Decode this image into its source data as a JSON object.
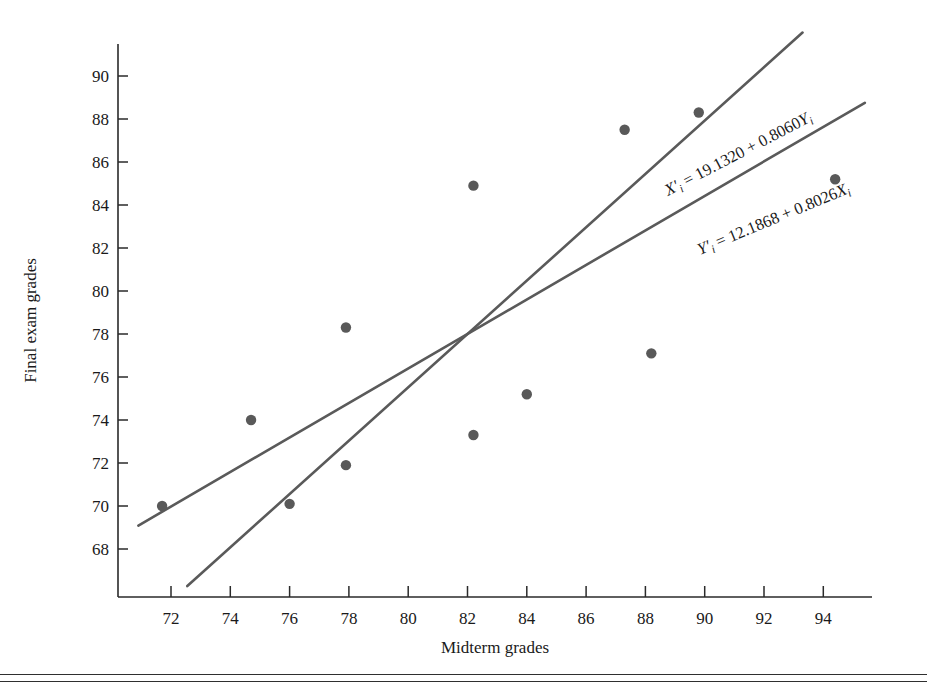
{
  "chart_data": {
    "type": "scatter",
    "title": "",
    "xlabel": "Midterm grades",
    "ylabel": "Final exam grades",
    "xlim": [
      70.6,
      95.6
    ],
    "ylim": [
      66.6,
      91.2
    ],
    "grid": false,
    "legend": "none",
    "x_ticks": [
      72,
      74,
      76,
      78,
      80,
      82,
      84,
      86,
      88,
      90,
      92,
      94
    ],
    "y_ticks": [
      68,
      70,
      72,
      74,
      76,
      78,
      80,
      82,
      84,
      86,
      88,
      90
    ],
    "x_tick_labels": [
      "72",
      "74",
      "76",
      "78",
      "80",
      "82",
      "84",
      "86",
      "88",
      "90",
      "92",
      "94"
    ],
    "y_tick_labels": [
      "68",
      "70",
      "72",
      "74",
      "76",
      "78",
      "80",
      "82",
      "84",
      "86",
      "88",
      "90"
    ],
    "points": [
      {
        "x": 71.7,
        "y": 70.0
      },
      {
        "x": 74.7,
        "y": 74.0
      },
      {
        "x": 76.0,
        "y": 70.1
      },
      {
        "x": 77.9,
        "y": 78.3
      },
      {
        "x": 77.9,
        "y": 71.9
      },
      {
        "x": 82.2,
        "y": 84.9
      },
      {
        "x": 82.2,
        "y": 73.3
      },
      {
        "x": 84.0,
        "y": 75.2
      },
      {
        "x": 87.3,
        "y": 87.5
      },
      {
        "x": 88.2,
        "y": 77.1
      },
      {
        "x": 89.8,
        "y": 88.3
      },
      {
        "x": 94.4,
        "y": 85.2
      }
    ],
    "lines": [
      {
        "name": "x-on-y-regression",
        "equation_text": "X'i = 19.1320 + 0.8060Yi",
        "lhs": "X",
        "prime": "′",
        "lhs_sub": "i",
        "rhs_plain": " = 19.1320 + 0.8060",
        "rhs_var": "Y",
        "rhs_sub": "i",
        "intercept": 19.132,
        "slope": 0.806,
        "form": "x = a + b*y",
        "x_start": 72.55,
        "x_end": 93.3
      },
      {
        "name": "y-on-x-regression",
        "equation_text": "Y'i = 12.1868 + 0.8026Xi",
        "lhs": "Y",
        "prime": "′",
        "lhs_sub": "i",
        "rhs_plain": " = 12.1868 + 0.8026",
        "rhs_var": "X",
        "rhs_sub": "i",
        "intercept": 12.1868,
        "slope": 0.8026,
        "form": "y = a + b*x",
        "x_start": 70.9,
        "x_end": 95.4
      }
    ],
    "colors": {
      "point": "#595959",
      "line": "#5a5a5a",
      "axis": "#2a2a2a",
      "text": "#1a1a1a",
      "background": "#ffffff"
    }
  }
}
